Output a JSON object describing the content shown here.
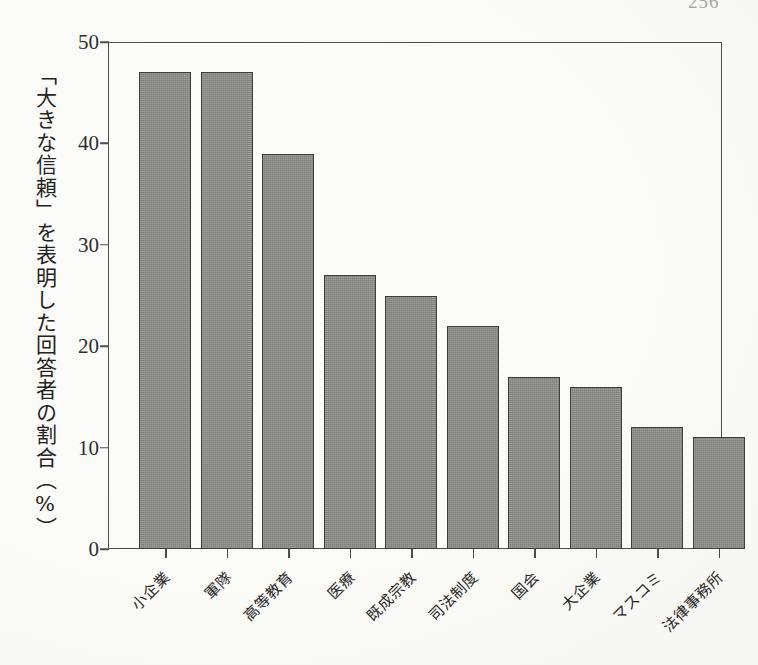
{
  "page": {
    "page_number": "256",
    "background_color": "#fdfdfc",
    "frame_color": "#4c4c4a"
  },
  "chart_data": {
    "type": "bar",
    "title": "",
    "subtitle": "",
    "xlabel": "",
    "ylabel": "「大きな信頼」を表明した回答者の割合（%）",
    "ylim": [
      0,
      50
    ],
    "ytick_values": [
      0,
      10,
      20,
      30,
      40,
      50
    ],
    "ytick_labels": [
      "0",
      "10",
      "20",
      "30",
      "40",
      "50"
    ],
    "grid": false,
    "legend": null,
    "bar_color": "#8b8b88",
    "bar_edge_color": "#3d3d3b",
    "categories": [
      "小企業",
      "軍隊",
      "高等教育",
      "医療",
      "既成宗教",
      "司法制度",
      "国会",
      "大企業",
      "マスコミ",
      "法律事務所"
    ],
    "values": [
      47,
      47,
      39,
      27,
      25,
      22,
      17,
      16,
      12,
      11
    ]
  }
}
